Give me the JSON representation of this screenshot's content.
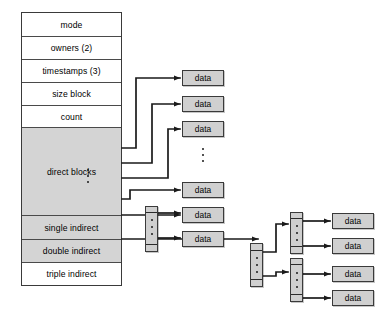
{
  "diagram": {
    "colors": {
      "shaded_cell": "#d4d4d4",
      "data_block": "#d0d0d0",
      "indirect_block": "#cfcfcf",
      "line": "#1a1a1a",
      "border": "#3a3a3a",
      "background": "#ffffff"
    }
  },
  "inode": {
    "name": "inode",
    "rows": [
      {
        "label": "mode",
        "shaded": false
      },
      {
        "label": "owners (2)",
        "shaded": false
      },
      {
        "label": "timestamps (3)",
        "shaded": false
      },
      {
        "label": "size block",
        "shaded": false
      },
      {
        "label": "count",
        "shaded": false
      },
      {
        "label": "direct blocks",
        "shaded": true
      },
      {
        "label": "single indirect",
        "shaded": true
      },
      {
        "label": "double indirect",
        "shaded": true
      },
      {
        "label": "triple indirect",
        "shaded": false
      }
    ]
  },
  "data_blocks": {
    "label": "data",
    "direct_column": [
      {
        "label": "data"
      },
      {
        "label": "data"
      },
      {
        "label": "data"
      },
      {
        "label": "data"
      },
      {
        "label": "data"
      },
      {
        "label": "data"
      }
    ],
    "single_indirect_column": [
      {
        "label": "data"
      },
      {
        "label": "data"
      }
    ],
    "triple_level_column": [
      {
        "label": "data"
      },
      {
        "label": "data"
      },
      {
        "label": "data"
      },
      {
        "label": "data"
      }
    ]
  },
  "indirect_blocks": [
    {
      "name": "single-indirect-block"
    },
    {
      "name": "double-indirect-block"
    },
    {
      "name": "triple-indirect-block-upper"
    },
    {
      "name": "triple-indirect-block-lower"
    }
  ],
  "ellipsis": {
    "glyph": "vertical-ellipsis"
  }
}
